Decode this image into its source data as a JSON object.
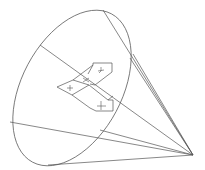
{
  "diagram": {
    "type": "cone-with-coordinate-frame",
    "colors": {
      "background": "#ffffff",
      "stroke": "#555555"
    },
    "cone": {
      "apex": [
        193,
        155
      ],
      "base_ellipse": {
        "cx": 72,
        "cy": 88,
        "rx": 52,
        "ry": 84,
        "rotate": 28
      }
    },
    "frame": {
      "axes": [
        "x",
        "y",
        "z"
      ],
      "markers": [
        "+",
        "+",
        "+"
      ]
    }
  }
}
